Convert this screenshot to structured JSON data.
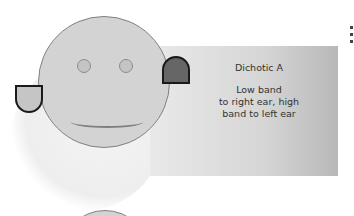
{
  "diagram": {
    "label_title": "Dichotic A",
    "label_line1": "Low band",
    "label_line2": "to right ear, high",
    "label_line3": "band to left ear",
    "colors": {
      "face": "#d3d3d3",
      "face_outline": "#808080",
      "left_ear": "#c5c5c5",
      "right_ear": "#666666",
      "panel_gradient_start": "#e9e9e9",
      "panel_gradient_end": "#b8b8b8"
    }
  }
}
